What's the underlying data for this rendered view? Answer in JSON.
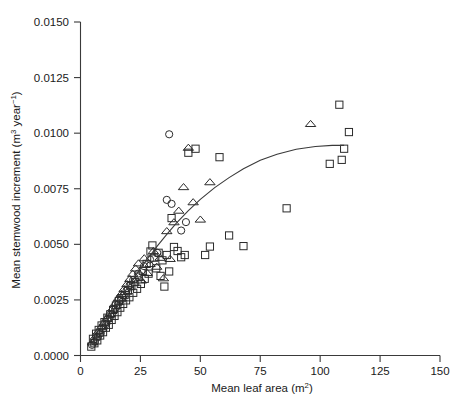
{
  "chart_data": {
    "type": "scatter",
    "title": "",
    "xlabel": "Mean leaf area (m2)",
    "xlabel_base": "Mean leaf area (m",
    "xlabel_sup": "2",
    "xlabel_tail": ")",
    "ylabel": "Mean stemwood increment (m3 year-1)",
    "ylabel_part1": "Mean stemwood increment (m",
    "ylabel_sup1": "3",
    "ylabel_part2": " year",
    "ylabel_sup2": "−1",
    "ylabel_part3": ")",
    "xlim": [
      0,
      150
    ],
    "ylim": [
      0.0,
      0.015
    ],
    "xticks": [
      0,
      25,
      50,
      75,
      100,
      125,
      150
    ],
    "xticklabels": [
      "0",
      "25",
      "50",
      "75",
      "100",
      "125",
      "150"
    ],
    "yticks": [
      0.0,
      0.0025,
      0.005,
      0.0075,
      0.01,
      0.0125,
      0.015
    ],
    "yticklabels": [
      "0.0000",
      "0.0025",
      "0.0050",
      "0.0075",
      "0.0100",
      "0.0125",
      "0.0150"
    ],
    "grid": false,
    "legend": "none",
    "marker_color": "#2b2b2b",
    "curve_color": "#3a3a3a",
    "series": [
      {
        "name": "squares",
        "marker": "open-square",
        "points": [
          [
            4.5,
            0.0004
          ],
          [
            5.2,
            0.00075
          ],
          [
            5.8,
            0.00055
          ],
          [
            6.5,
            0.00098
          ],
          [
            7.0,
            0.00068
          ],
          [
            7.6,
            0.00115
          ],
          [
            8.2,
            0.0009
          ],
          [
            8.8,
            0.00135
          ],
          [
            9.4,
            0.00105
          ],
          [
            10.0,
            0.0015
          ],
          [
            10.6,
            0.00125
          ],
          [
            11.2,
            0.0017
          ],
          [
            11.8,
            0.00138
          ],
          [
            12.4,
            0.00185
          ],
          [
            13.0,
            0.0016
          ],
          [
            13.6,
            0.00205
          ],
          [
            14.2,
            0.00178
          ],
          [
            14.8,
            0.00225
          ],
          [
            15.4,
            0.00195
          ],
          [
            16.0,
            0.00245
          ],
          [
            16.6,
            0.00215
          ],
          [
            17.2,
            0.00258
          ],
          [
            17.8,
            0.00232
          ],
          [
            18.4,
            0.00272
          ],
          [
            19.0,
            0.00248
          ],
          [
            19.8,
            0.00292
          ],
          [
            20.4,
            0.00262
          ],
          [
            21.2,
            0.00312
          ],
          [
            22.0,
            0.00282
          ],
          [
            22.8,
            0.0033
          ],
          [
            23.6,
            0.003
          ],
          [
            24.4,
            0.00355
          ],
          [
            25.2,
            0.00322
          ],
          [
            26.0,
            0.0038
          ],
          [
            26.8,
            0.00345
          ],
          [
            27.6,
            0.00412
          ],
          [
            28.4,
            0.00368
          ],
          [
            29.2,
            0.00468
          ],
          [
            30.0,
            0.00495
          ],
          [
            30.8,
            0.0044
          ],
          [
            31.6,
            0.00392
          ],
          [
            32.6,
            0.00462
          ],
          [
            33.4,
            0.00358
          ],
          [
            34.2,
            0.00428
          ],
          [
            35.0,
            0.0031
          ],
          [
            36.0,
            0.00452
          ],
          [
            37.0,
            0.00378
          ],
          [
            38.0,
            0.00618
          ],
          [
            39.0,
            0.00488
          ],
          [
            40.5,
            0.0047
          ],
          [
            42.0,
            0.00442
          ],
          [
            43.5,
            0.00452
          ],
          [
            45.0,
            0.00912
          ],
          [
            48.0,
            0.0093
          ],
          [
            52.0,
            0.00452
          ],
          [
            54.0,
            0.0049
          ],
          [
            58.0,
            0.00892
          ],
          [
            62.0,
            0.0054
          ],
          [
            68.0,
            0.00492
          ],
          [
            86.0,
            0.00662
          ],
          [
            104.0,
            0.00862
          ],
          [
            108.0,
            0.01128
          ],
          [
            109.0,
            0.0088
          ],
          [
            110.0,
            0.0093
          ],
          [
            112.0,
            0.01005
          ]
        ]
      },
      {
        "name": "triangles",
        "marker": "open-triangle",
        "points": [
          [
            5.0,
            0.0006
          ],
          [
            6.2,
            0.00085
          ],
          [
            7.4,
            0.00108
          ],
          [
            8.6,
            0.00128
          ],
          [
            9.8,
            0.00148
          ],
          [
            11.0,
            0.00168
          ],
          [
            12.2,
            0.00188
          ],
          [
            13.4,
            0.00212
          ],
          [
            14.6,
            0.00236
          ],
          [
            15.8,
            0.00258
          ],
          [
            17.0,
            0.00278
          ],
          [
            18.2,
            0.003
          ],
          [
            19.4,
            0.00322
          ],
          [
            20.6,
            0.00345
          ],
          [
            21.8,
            0.00368
          ],
          [
            23.0,
            0.00392
          ],
          [
            24.2,
            0.00415
          ],
          [
            25.4,
            0.00338
          ],
          [
            26.6,
            0.00438
          ],
          [
            27.8,
            0.00372
          ],
          [
            29.0,
            0.00412
          ],
          [
            30.4,
            0.0047
          ],
          [
            31.8,
            0.004
          ],
          [
            33.2,
            0.0044
          ],
          [
            34.6,
            0.00348
          ],
          [
            36.0,
            0.0056
          ],
          [
            37.4,
            0.00435
          ],
          [
            39.0,
            0.006
          ],
          [
            41.0,
            0.00652
          ],
          [
            43.0,
            0.00758
          ],
          [
            45.0,
            0.00935
          ],
          [
            47.0,
            0.0069
          ],
          [
            50.0,
            0.00612
          ],
          [
            54.0,
            0.0078
          ],
          [
            96.0,
            0.01042
          ]
        ]
      },
      {
        "name": "circles",
        "marker": "open-circle",
        "points": [
          [
            4.8,
            0.00048
          ],
          [
            6.0,
            0.00062
          ],
          [
            7.2,
            0.00082
          ],
          [
            8.4,
            0.001
          ],
          [
            9.6,
            0.00122
          ],
          [
            10.8,
            0.00142
          ],
          [
            12.0,
            0.00165
          ],
          [
            13.2,
            0.00186
          ],
          [
            14.4,
            0.00208
          ],
          [
            15.6,
            0.00228
          ],
          [
            16.8,
            0.0025
          ],
          [
            18.0,
            0.0027
          ],
          [
            19.2,
            0.00292
          ],
          [
            20.5,
            0.00316
          ],
          [
            22.0,
            0.0034
          ],
          [
            24.0,
            0.00368
          ],
          [
            26.5,
            0.00402
          ],
          [
            29.0,
            0.00432
          ],
          [
            32.0,
            0.00462
          ],
          [
            36.0,
            0.007
          ],
          [
            37.0,
            0.00995
          ],
          [
            38.0,
            0.00682
          ],
          [
            42.0,
            0.00562
          ],
          [
            44.0,
            0.006
          ]
        ]
      }
    ],
    "fit_curve": {
      "name": "fitted-saturating-curve",
      "points": [
        [
          5.0,
          0.0005
        ],
        [
          8.0,
          0.00105
        ],
        [
          11.0,
          0.00158
        ],
        [
          14.0,
          0.00212
        ],
        [
          17.0,
          0.00262
        ],
        [
          20.0,
          0.00312
        ],
        [
          24.0,
          0.00375
        ],
        [
          28.0,
          0.00435
        ],
        [
          32.0,
          0.00492
        ],
        [
          36.0,
          0.00545
        ],
        [
          40.0,
          0.00595
        ],
        [
          45.0,
          0.00652
        ],
        [
          50.0,
          0.00702
        ],
        [
          56.0,
          0.00755
        ],
        [
          62.0,
          0.008
        ],
        [
          68.0,
          0.0084
        ],
        [
          75.0,
          0.00878
        ],
        [
          82.0,
          0.00905
        ],
        [
          90.0,
          0.00928
        ],
        [
          98.0,
          0.0094
        ],
        [
          105.0,
          0.00945
        ],
        [
          110.0,
          0.00945
        ]
      ]
    }
  }
}
